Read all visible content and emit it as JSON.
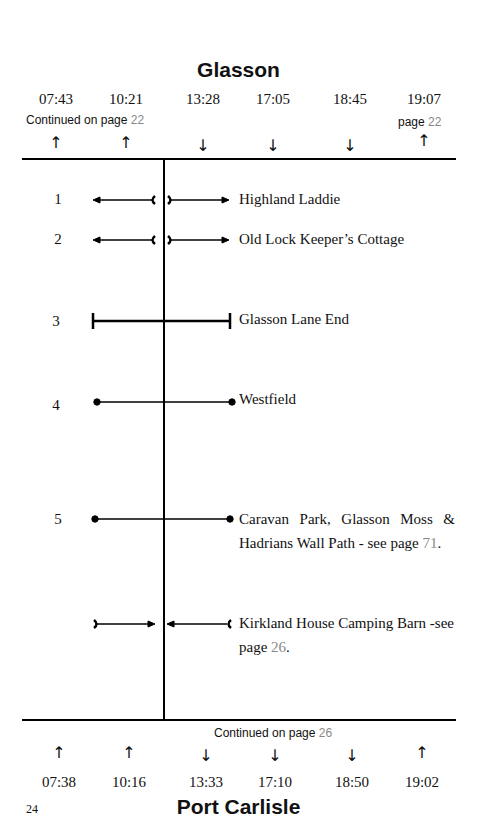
{
  "header": {
    "stop": "Glasson",
    "times": [
      "07:43",
      "10:21",
      "13:28",
      "17:05",
      "18:45",
      "19:07"
    ],
    "directions": [
      "up",
      "up",
      "down",
      "down",
      "down",
      "up"
    ],
    "continued_left": {
      "text": "Continued on page ",
      "page": "22"
    },
    "continued_right": {
      "text": "page ",
      "page": "22"
    }
  },
  "rows": [
    {
      "number": "1",
      "label": "Highland Laddie",
      "type": "both-away"
    },
    {
      "number": "2",
      "label": "Old Lock Keeper’s Cottage",
      "type": "both-away"
    },
    {
      "number": "3",
      "label": "Glasson Lane End",
      "type": "bar"
    },
    {
      "number": "4",
      "label": "Westfield",
      "type": "dots"
    },
    {
      "number": "5",
      "label": "Caravan Park, Glasson Moss & Hadrians Wall Path - see page ",
      "page": "71",
      "type": "dots"
    },
    {
      "number": "",
      "label": "Kirkland House Camping Barn -see page ",
      "page": "26",
      "type": "both-toward"
    }
  ],
  "footer": {
    "stop": "Port Carlisle",
    "times": [
      "07:38",
      "10:16",
      "13:33",
      "17:10",
      "18:50",
      "19:02"
    ],
    "directions": [
      "up",
      "up",
      "down",
      "down",
      "down",
      "up"
    ],
    "continued": {
      "text": "Continued on page ",
      "page": "26"
    },
    "page_number": "24"
  },
  "arrows": {
    "up": "↑",
    "down": "↓"
  }
}
